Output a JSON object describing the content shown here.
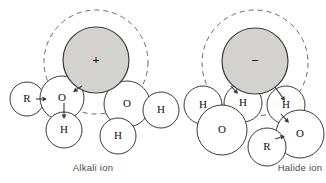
{
  "figure": {
    "background_color": "#ffffff",
    "stroke_color": "#3a3a3a",
    "ion_fill_color": "#d4d2cf",
    "water_fill_color": "#ffffff",
    "dashed_color": "#6a6a6a",
    "label_color": "#111111",
    "caption_color": "#4a4a4a"
  },
  "panels": [
    {
      "id": "alkali",
      "caption": "Alkali ion",
      "ion": {
        "label": "+",
        "name": "alkali-cation",
        "cx": 96,
        "cy": 60,
        "r": 33,
        "fill": "#d4d2cf"
      },
      "hydration_shell": {
        "cx": 96,
        "cy": 62,
        "r": 52,
        "dash": "5 4"
      },
      "atoms": [
        {
          "label": "R",
          "kind": "R",
          "cx": 27,
          "cy": 99,
          "r": 17
        },
        {
          "label": "O",
          "kind": "O",
          "cx": 62,
          "cy": 98,
          "r": 22
        },
        {
          "label": "H",
          "kind": "H",
          "cx": 64,
          "cy": 130,
          "r": 18
        },
        {
          "label": "O",
          "kind": "O",
          "cx": 127,
          "cy": 104,
          "r": 23
        },
        {
          "label": "H",
          "kind": "H",
          "cx": 161,
          "cy": 110,
          "r": 18
        },
        {
          "label": "H",
          "kind": "H",
          "cx": 118,
          "cy": 136,
          "r": 18
        }
      ],
      "dipole_arrows": [
        {
          "name": "dipole-arrow-r-o",
          "x1": 36,
          "y1": 99,
          "x2": 47,
          "y2": 99
        },
        {
          "name": "dipole-arrow-o-h",
          "x1": 64,
          "y1": 103,
          "x2": 64,
          "y2": 119
        },
        {
          "name": "dipole-arrow-ion-o",
          "x1": 82,
          "y1": 86,
          "x2": 73,
          "y2": 92
        }
      ]
    },
    {
      "id": "halide",
      "caption": "Halide ion",
      "ion": {
        "label": "−",
        "name": "halide-anion",
        "cx": 255,
        "cy": 61,
        "r": 33,
        "fill": "#d4d2cf"
      },
      "hydration_shell": {
        "cx": 255,
        "cy": 63,
        "r": 53,
        "dash": "5 4"
      },
      "atoms": [
        {
          "label": "H",
          "kind": "H",
          "cx": 203,
          "cy": 105,
          "r": 19
        },
        {
          "label": "H",
          "kind": "H",
          "cx": 243,
          "cy": 103,
          "r": 19
        },
        {
          "label": "H",
          "kind": "H",
          "cx": 286,
          "cy": 105,
          "r": 19
        },
        {
          "label": "O",
          "kind": "O",
          "cx": 222,
          "cy": 130,
          "r": 25
        },
        {
          "label": "O",
          "kind": "O",
          "cx": 300,
          "cy": 134,
          "r": 24
        },
        {
          "label": "R",
          "kind": "R",
          "cx": 267,
          "cy": 147,
          "r": 19
        }
      ],
      "dipole_arrows": [
        {
          "name": "dipole-arrow-ion-h-left",
          "x1": 231,
          "y1": 86,
          "x2": 238,
          "y2": 94
        },
        {
          "name": "dipole-arrow-ion-h-right",
          "x1": 275,
          "y1": 87,
          "x2": 285,
          "y2": 101
        },
        {
          "name": "dipole-arrow-h-o",
          "x1": 281,
          "y1": 114,
          "x2": 289,
          "y2": 123
        },
        {
          "name": "dipole-arrow-r-o",
          "x1": 275,
          "y1": 139,
          "x2": 285,
          "y2": 136
        }
      ]
    }
  ],
  "chart_data": {
    "type": "diagram",
    "panels": [
      {
        "name": "Alkali ion",
        "central_ion_charge": "+",
        "shell_style": "dashed circle",
        "surrounding_species": [
          "R",
          "O",
          "H",
          "O",
          "H",
          "H"
        ],
        "orientation_note": "Water oxygen atoms point toward the positive ion"
      },
      {
        "name": "Halide ion",
        "central_ion_charge": "−",
        "shell_style": "dashed circle",
        "surrounding_species": [
          "H",
          "H",
          "H",
          "O",
          "O",
          "R"
        ],
        "orientation_note": "Water hydrogen atoms point toward the negative ion"
      }
    ]
  }
}
